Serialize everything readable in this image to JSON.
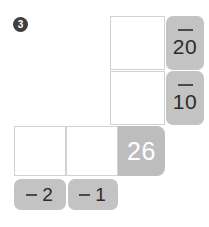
{
  "exercise": {
    "number": "3"
  },
  "rows": [
    {
      "answer_box_value": "",
      "operand": {
        "sign": "minus",
        "value": "20"
      }
    },
    {
      "answer_box_value": "",
      "operand": {
        "sign": "minus",
        "value": "10"
      }
    }
  ],
  "bottom_row": {
    "answer_box_left_value": "",
    "answer_box_right_value": "",
    "result": "26",
    "labels": [
      {
        "sign": "minus",
        "value": "2"
      },
      {
        "sign": "minus",
        "value": "1"
      }
    ]
  },
  "colors": {
    "badge": "#3f3f3f",
    "operand_tab": "#c3c3c3",
    "result_box": "#bdbdbd",
    "cell_border": "#d2d2d2",
    "result_text": "#ffffff",
    "page_background": "#ffffff"
  }
}
